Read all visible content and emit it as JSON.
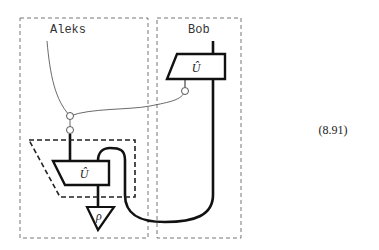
{
  "diagram": {
    "regions": [
      {
        "name": "Aleks",
        "label": "Aleks"
      },
      {
        "name": "Bob",
        "label": "Bob"
      }
    ],
    "boxes": [
      {
        "id": "bob-U",
        "label": "Û",
        "owner": "Bob"
      },
      {
        "id": "aleks-U",
        "label": "Û",
        "owner": "Aleks"
      }
    ],
    "state": {
      "label": "ρ"
    },
    "equation_number": "(8.91)"
  }
}
